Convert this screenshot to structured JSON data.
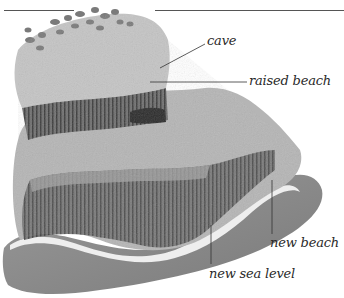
{
  "diagram": {
    "labels": [
      {
        "id": "cave",
        "text": "cave"
      },
      {
        "id": "raised_beach",
        "text": "raised beach"
      },
      {
        "id": "new_beach",
        "text": "new beach"
      },
      {
        "id": "new_sea_level",
        "text": "new sea level"
      }
    ],
    "colors": {
      "background": "#ffffff",
      "rock_light": "#b9b9b9",
      "rock_dark": "#4a4a4a",
      "surf": "#eeeeee",
      "sea": "#8c8c8c",
      "leader_line": "#555555",
      "label_text": "#2a2a2a"
    }
  }
}
